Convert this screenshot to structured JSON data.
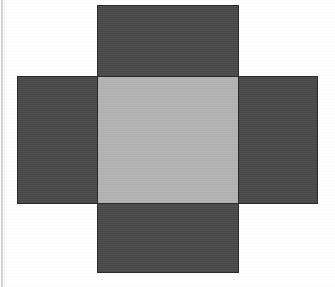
{
  "figure": {
    "title": "Cube net (cross-shaped arrangement of five squares)",
    "description": "A plus/cross shaped net made of one light gray central square with four dark gray squares attached to its top, bottom, left and right edges.",
    "background_color": "#ffffff",
    "center_fill": "#b4b4b4",
    "arm_fill": "#4a4a4a",
    "outline_color": "#2b2b2b",
    "outline_width_px": 1.5,
    "edge_line_color": "#c9c9c9"
  },
  "faces": [
    {
      "id": "top",
      "label": "Top square",
      "fill": "#4a4a4a",
      "x": 97,
      "y": 5,
      "width": 142,
      "height": 73
    },
    {
      "id": "left",
      "label": "Left square",
      "fill": "#4a4a4a",
      "x": 17,
      "y": 76,
      "width": 81,
      "height": 128
    },
    {
      "id": "center",
      "label": "Center square",
      "fill": "#b4b4b4",
      "x": 97,
      "y": 76,
      "width": 142,
      "height": 128
    },
    {
      "id": "right",
      "label": "Right square",
      "fill": "#4a4a4a",
      "x": 238,
      "y": 76,
      "width": 80,
      "height": 128
    },
    {
      "id": "bottom",
      "label": "Bottom square",
      "fill": "#4a4a4a",
      "x": 97,
      "y": 203,
      "width": 142,
      "height": 70
    }
  ],
  "chart_data": {
    "type": "diagram",
    "title": "Cube net (cross-shaped arrangement of five squares)",
    "shape": "plus/cross",
    "square_count": 5,
    "categories": [
      "top",
      "left",
      "center",
      "right",
      "bottom"
    ],
    "fills": [
      "#4a4a4a",
      "#4a4a4a",
      "#b4b4b4",
      "#4a4a4a",
      "#4a4a4a"
    ],
    "xlabel": "",
    "ylabel": "",
    "grid": false,
    "legend": false
  }
}
